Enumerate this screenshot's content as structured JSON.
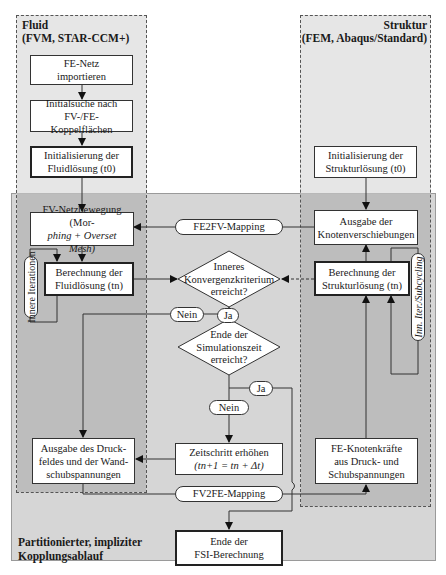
{
  "zones": {
    "fluid": {
      "title_line1": "Fluid",
      "title_line2": "(FVM, STAR-CCM+)"
    },
    "structure": {
      "title_line1": "Struktur",
      "title_line2": "(FEM, Abaqus/Standard)"
    },
    "coupling": {
      "label_line1": "Partitionierter, impliziter",
      "label_line2": "Kopplungsablauf"
    }
  },
  "fluid_steps": {
    "import_mesh": {
      "line1": "FE-Netz",
      "line2": "importieren"
    },
    "initial_search": {
      "line1": "Initialsuche nach",
      "line2": "FV-/FE-Koppelflächen"
    },
    "init_fluid": {
      "line1": "Initialisierung der",
      "line2": "Fluidlösung (t0)"
    },
    "mesh_motion": {
      "line1": "FV-Netzbewegung (Mor-",
      "line2": "phing + Overset Mesh)"
    },
    "compute_fluid": {
      "line1": "Berechnung der",
      "line2": "Fluidlösung (tn)"
    },
    "output_pressure": {
      "line1": "Ausgabe des Druck-",
      "line2": "feldes und der Wand-",
      "line3": "schubspannungen"
    },
    "inner_iterations": "Innere Iterationen"
  },
  "structure_steps": {
    "init_structure": {
      "line1": "Initialisierung der",
      "line2": "Strukturlösung (t0)"
    },
    "output_displacements": {
      "line1": "Ausgabe der",
      "line2": "Knotenverschiebungen"
    },
    "compute_structure": {
      "line1": "Berechnung der",
      "line2": "Strukturlösung (tn)"
    },
    "nodal_forces": {
      "line1": "FE-Knotenkräfte",
      "line2": "aus Druck- und",
      "line3": "Schubspannungen"
    },
    "inner_subcycling": "Inn. Iter./Subcycling"
  },
  "coupling_steps": {
    "fe2fv": "FE2FV-Mapping",
    "fv2fe": "FV2FE-Mapping",
    "convergence": {
      "line1": "Inneres",
      "line2": "Konvergenzkriterium",
      "line3": "erreicht?"
    },
    "end_time": {
      "line1": "Ende der",
      "line2": "Simulationszeit",
      "line3": "erreicht?"
    },
    "time_step": {
      "line1": "Zeitschritt erhöhen",
      "line2": "(tn+1 = tn + Δt)"
    },
    "end_fsi": {
      "line1": "Ende der",
      "line2": "FSI-Berechnung"
    },
    "no_label_1": "Nein",
    "yes_label_1": "Ja",
    "no_label_2": "Nein",
    "yes_label_2": "Ja"
  },
  "colors": {
    "outer_shade": "#d6d6d6",
    "inner_shade": "#b9b9b9",
    "line": "#333333",
    "box_fill": "#ffffff"
  }
}
